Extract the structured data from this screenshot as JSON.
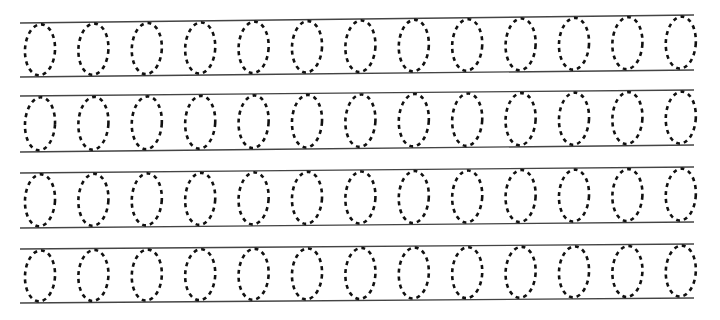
{
  "worksheet": {
    "title": "",
    "glyph": "0",
    "row_count": 4,
    "ovals_per_row": 13,
    "colors": {
      "background": "#ffffff",
      "rule_line": "#444444",
      "dash": "#111111"
    },
    "rows": [
      {
        "top_left_y": 23,
        "bottom_left_y": 77,
        "top_right_y": 15,
        "bottom_right_y": 70
      },
      {
        "top_left_y": 96,
        "bottom_left_y": 152,
        "top_right_y": 90,
        "bottom_right_y": 145
      },
      {
        "top_left_y": 173,
        "bottom_left_y": 228,
        "top_right_y": 167,
        "bottom_right_y": 222
      },
      {
        "top_left_y": 249,
        "bottom_left_y": 303,
        "top_right_y": 244,
        "bottom_right_y": 298
      }
    ],
    "line_x_start": 20,
    "line_x_end": 694,
    "first_oval_center_x": 40,
    "oval_spacing": 53.4,
    "oval_rx": 15,
    "oval_ry": 26
  }
}
